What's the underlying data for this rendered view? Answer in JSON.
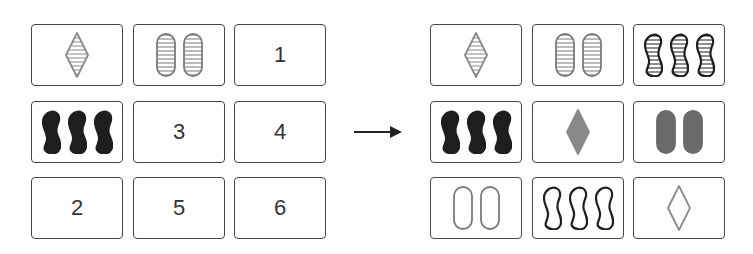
{
  "diagram": {
    "type": "matrix-completion-puzzle",
    "left_grid": {
      "cells": [
        {
          "row": 0,
          "col": 0,
          "kind": "shapes",
          "count": 1,
          "shape": "diamond",
          "shading": "striped",
          "color": "#8a8a8a"
        },
        {
          "row": 0,
          "col": 1,
          "kind": "shapes",
          "count": 2,
          "shape": "oval",
          "shading": "striped",
          "color": "#7a7a7a"
        },
        {
          "row": 0,
          "col": 2,
          "kind": "label",
          "label": "1"
        },
        {
          "row": 1,
          "col": 0,
          "kind": "shapes",
          "count": 3,
          "shape": "squiggle",
          "shading": "solid",
          "color": "#1e1e1e"
        },
        {
          "row": 1,
          "col": 1,
          "kind": "label",
          "label": "3"
        },
        {
          "row": 1,
          "col": 2,
          "kind": "label",
          "label": "4"
        },
        {
          "row": 2,
          "col": 0,
          "kind": "label",
          "label": "2"
        },
        {
          "row": 2,
          "col": 1,
          "kind": "label",
          "label": "5"
        },
        {
          "row": 2,
          "col": 2,
          "kind": "label",
          "label": "6"
        }
      ]
    },
    "arrow": {
      "direction": "right",
      "icon": "right-arrow-icon"
    },
    "right_grid": {
      "cells": [
        {
          "row": 0,
          "col": 0,
          "kind": "shapes",
          "count": 1,
          "shape": "diamond",
          "shading": "striped",
          "color": "#8a8a8a"
        },
        {
          "row": 0,
          "col": 1,
          "kind": "shapes",
          "count": 2,
          "shape": "oval",
          "shading": "striped",
          "color": "#7a7a7a"
        },
        {
          "row": 0,
          "col": 2,
          "kind": "shapes",
          "count": 3,
          "shape": "squiggle",
          "shading": "striped",
          "color": "#1e1e1e"
        },
        {
          "row": 1,
          "col": 0,
          "kind": "shapes",
          "count": 3,
          "shape": "squiggle",
          "shading": "solid",
          "color": "#1e1e1e"
        },
        {
          "row": 1,
          "col": 1,
          "kind": "shapes",
          "count": 1,
          "shape": "diamond",
          "shading": "solid",
          "color": "#8a8a8a"
        },
        {
          "row": 1,
          "col": 2,
          "kind": "shapes",
          "count": 2,
          "shape": "oval",
          "shading": "solid",
          "color": "#6a6a6a"
        },
        {
          "row": 2,
          "col": 0,
          "kind": "shapes",
          "count": 2,
          "shape": "oval",
          "shading": "outline",
          "color": "#7a7a7a"
        },
        {
          "row": 2,
          "col": 1,
          "kind": "shapes",
          "count": 3,
          "shape": "squiggle",
          "shading": "outline",
          "color": "#1e1e1e"
        },
        {
          "row": 2,
          "col": 2,
          "kind": "shapes",
          "count": 1,
          "shape": "diamond",
          "shading": "outline",
          "color": "#8a8a8a"
        }
      ]
    },
    "colors": {
      "card_border": "#444444",
      "label_text": "#333333",
      "arrow": "#222222"
    }
  }
}
